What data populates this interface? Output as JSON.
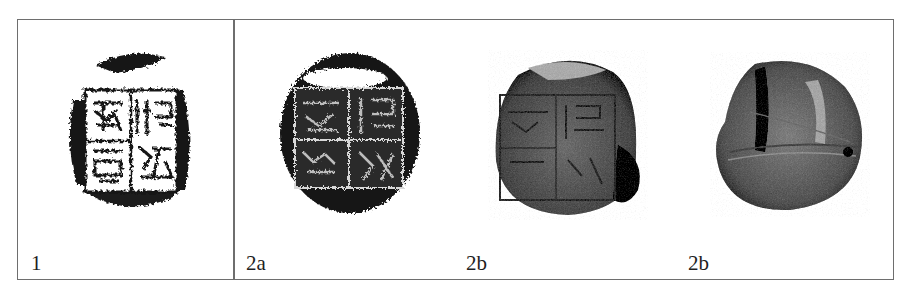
{
  "figure": {
    "panels": [
      {
        "id": "1",
        "label": "1",
        "description": "ink rubbing of square seal with four-character inscription"
      },
      {
        "id": "2a",
        "label": "2a",
        "description": "ink rubbing of seal impression"
      },
      {
        "id": "2b-front",
        "label": "2b",
        "description": "photograph of clay sealing, inscribed face"
      },
      {
        "id": "2b-back",
        "label": "2b",
        "description": "photograph of clay sealing, reverse side"
      }
    ]
  },
  "colors": {
    "border": "#6e6e6e",
    "ink": "#141414",
    "clay_dark": "#3c3c3c",
    "clay_mid": "#6a6a6a",
    "clay_light": "#9a9a9a"
  }
}
